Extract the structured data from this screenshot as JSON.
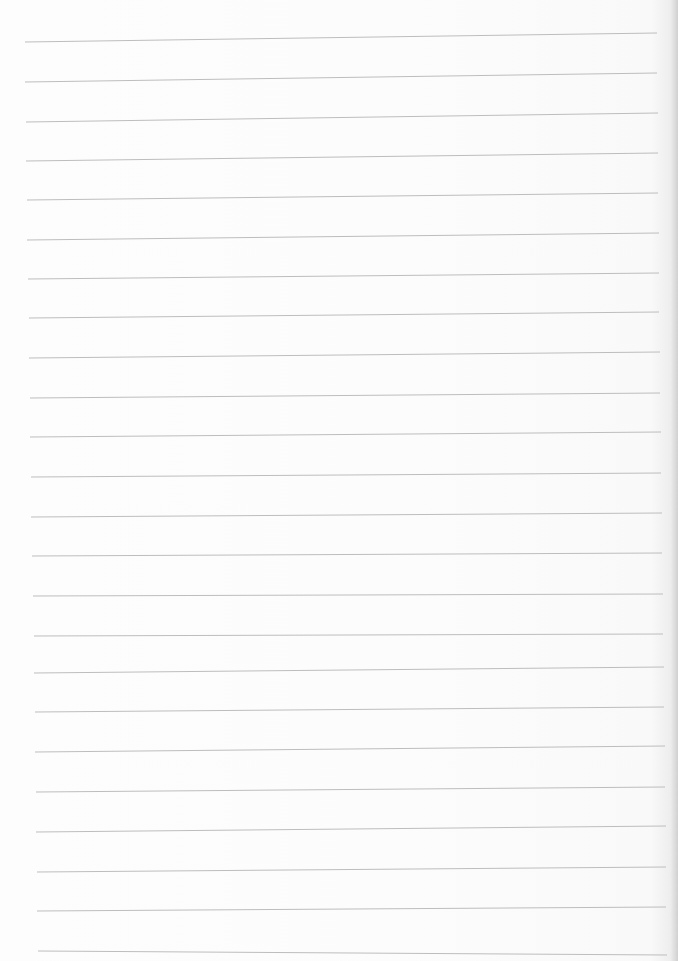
{
  "page": {
    "type": "lined-paper",
    "background_color": "#fdfdfd",
    "line_color": "#bdbdbd",
    "line_count": 24,
    "text": ""
  },
  "rules": [
    {
      "x1": 25,
      "y1": 42,
      "x2": 657,
      "y2": 33
    },
    {
      "x1": 25,
      "y1": 82,
      "x2": 657,
      "y2": 73
    },
    {
      "x1": 26,
      "y1": 122,
      "x2": 658,
      "y2": 113
    },
    {
      "x1": 26,
      "y1": 161,
      "x2": 658,
      "y2": 153
    },
    {
      "x1": 27,
      "y1": 200,
      "x2": 658,
      "y2": 193
    },
    {
      "x1": 27,
      "y1": 240,
      "x2": 659,
      "y2": 233
    },
    {
      "x1": 28,
      "y1": 279,
      "x2": 659,
      "y2": 273
    },
    {
      "x1": 29,
      "y1": 318,
      "x2": 659,
      "y2": 312
    },
    {
      "x1": 29,
      "y1": 358,
      "x2": 660,
      "y2": 352
    },
    {
      "x1": 30,
      "y1": 398,
      "x2": 660,
      "y2": 393
    },
    {
      "x1": 30,
      "y1": 437,
      "x2": 661,
      "y2": 432
    },
    {
      "x1": 31,
      "y1": 477,
      "x2": 661,
      "y2": 473
    },
    {
      "x1": 31,
      "y1": 517,
      "x2": 662,
      "y2": 513
    },
    {
      "x1": 32,
      "y1": 556,
      "x2": 662,
      "y2": 553
    },
    {
      "x1": 33,
      "y1": 596,
      "x2": 663,
      "y2": 594
    },
    {
      "x1": 34,
      "y1": 636,
      "x2": 663,
      "y2": 634
    },
    {
      "x1": 34,
      "y1": 673,
      "x2": 664,
      "y2": 667
    },
    {
      "x1": 35,
      "y1": 712,
      "x2": 664,
      "y2": 707
    },
    {
      "x1": 35,
      "y1": 752,
      "x2": 665,
      "y2": 746
    },
    {
      "x1": 36,
      "y1": 792,
      "x2": 665,
      "y2": 787
    },
    {
      "x1": 36,
      "y1": 832,
      "x2": 666,
      "y2": 826
    },
    {
      "x1": 37,
      "y1": 872,
      "x2": 666,
      "y2": 867
    },
    {
      "x1": 37,
      "y1": 911,
      "x2": 666,
      "y2": 907
    },
    {
      "x1": 38,
      "y1": 951,
      "x2": 667,
      "y2": 955
    }
  ]
}
